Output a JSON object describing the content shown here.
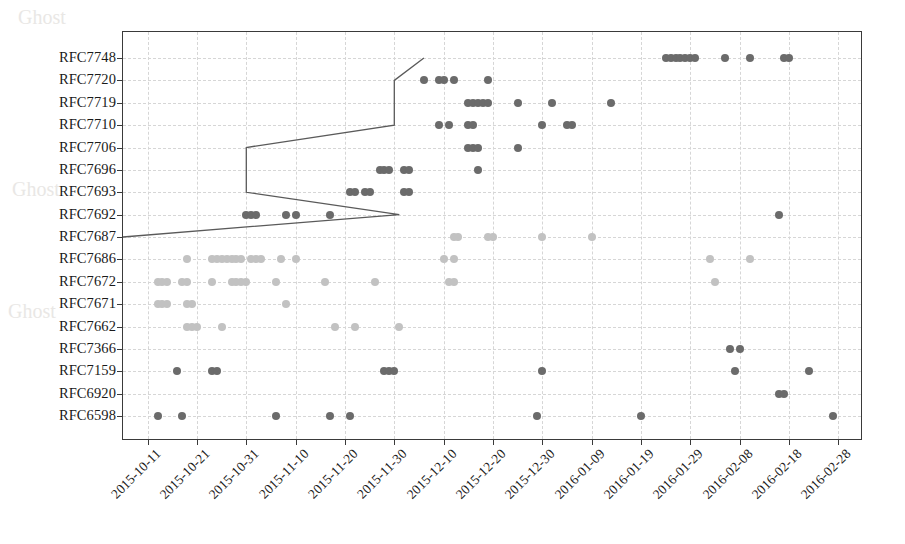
{
  "chart_data": {
    "type": "scatter",
    "title": "",
    "xlabel": "",
    "ylabel": "",
    "grid": true,
    "legend": false,
    "x_tick_labels": [
      "2015-10-11",
      "2015-10-21",
      "2015-10-31",
      "2015-11-10",
      "2015-11-20",
      "2015-11-30",
      "2015-12-10",
      "2015-12-20",
      "2015-12-30",
      "2016-01-09",
      "2016-01-19",
      "2016-01-29",
      "2016-02-08",
      "2016-02-18",
      "2016-02-28"
    ],
    "xlim": [
      "2015-10-06",
      "2016-03-04"
    ],
    "categories": [
      "RFC7748",
      "RFC7720",
      "RFC7719",
      "RFC7710",
      "RFC7706",
      "RFC7696",
      "RFC7693",
      "RFC7692",
      "RFC7687",
      "RFC7686",
      "RFC7672",
      "RFC7671",
      "RFC7662",
      "RFC7366",
      "RFC7159",
      "RFC6920",
      "RFC6598"
    ],
    "colors": {
      "point_dark": "#6b6b6b",
      "point_light": "#c2c2c2",
      "line": "#5a5a5a",
      "axis": "#3a3a3a",
      "grid": "#d6d6d6",
      "background": "#ffffff"
    },
    "series": [
      {
        "name": "RFC7748",
        "category_index": 0,
        "shade": "dark",
        "x": [
          "2016-01-24",
          "2016-01-25",
          "2016-01-26",
          "2016-01-27",
          "2016-01-28",
          "2016-01-29",
          "2016-01-30",
          "2016-02-05",
          "2016-02-10",
          "2016-02-17",
          "2016-02-18"
        ]
      },
      {
        "name": "RFC7720",
        "category_index": 1,
        "shade": "dark",
        "x": [
          "2015-12-06",
          "2015-12-09",
          "2015-12-10",
          "2015-12-12",
          "2015-12-19"
        ]
      },
      {
        "name": "RFC7719",
        "category_index": 2,
        "shade": "dark",
        "x": [
          "2015-12-15",
          "2015-12-16",
          "2015-12-17",
          "2015-12-18",
          "2015-12-19",
          "2015-12-25",
          "2016-01-01",
          "2016-01-13"
        ]
      },
      {
        "name": "RFC7710",
        "category_index": 3,
        "shade": "dark",
        "x": [
          "2015-12-09",
          "2015-12-11",
          "2015-12-15",
          "2015-12-16",
          "2015-12-30",
          "2016-01-04",
          "2016-01-05"
        ]
      },
      {
        "name": "RFC7706",
        "category_index": 4,
        "shade": "dark",
        "x": [
          "2015-12-15",
          "2015-12-16",
          "2015-12-17",
          "2015-12-25"
        ]
      },
      {
        "name": "RFC7696",
        "category_index": 5,
        "shade": "dark",
        "x": [
          "2015-11-27",
          "2015-11-28",
          "2015-11-29",
          "2015-12-02",
          "2015-12-03",
          "2015-12-17"
        ]
      },
      {
        "name": "RFC7693",
        "category_index": 6,
        "shade": "dark",
        "x": [
          "2015-11-21",
          "2015-11-22",
          "2015-11-24",
          "2015-11-25",
          "2015-12-02",
          "2015-12-03"
        ]
      },
      {
        "name": "RFC7692",
        "category_index": 7,
        "shade": "dark",
        "x": [
          "2015-10-31",
          "2015-11-01",
          "2015-11-02",
          "2015-11-08",
          "2015-11-10",
          "2015-11-17",
          "2016-02-16"
        ]
      },
      {
        "name": "RFC7687",
        "category_index": 8,
        "shade": "light",
        "x": [
          "2015-12-12",
          "2015-12-13",
          "2015-12-19",
          "2015-12-20",
          "2015-12-30",
          "2016-01-09"
        ]
      },
      {
        "name": "RFC7686",
        "category_index": 9,
        "shade": "light",
        "x": [
          "2015-10-19",
          "2015-10-24",
          "2015-10-25",
          "2015-10-26",
          "2015-10-27",
          "2015-10-28",
          "2015-10-29",
          "2015-10-30",
          "2015-11-01",
          "2015-11-02",
          "2015-11-03",
          "2015-11-07",
          "2015-11-10",
          "2015-12-10",
          "2015-12-12",
          "2016-02-02",
          "2016-02-10"
        ]
      },
      {
        "name": "RFC7672",
        "category_index": 10,
        "shade": "light",
        "x": [
          "2015-10-13",
          "2015-10-14",
          "2015-10-15",
          "2015-10-18",
          "2015-10-19",
          "2015-10-24",
          "2015-10-28",
          "2015-10-29",
          "2015-10-30",
          "2015-10-31",
          "2015-11-06",
          "2015-11-16",
          "2015-11-26",
          "2015-12-11",
          "2015-12-12",
          "2016-02-03"
        ]
      },
      {
        "name": "RFC7671",
        "category_index": 11,
        "shade": "light",
        "x": [
          "2015-10-13",
          "2015-10-14",
          "2015-10-15",
          "2015-10-19",
          "2015-10-20",
          "2015-11-08"
        ]
      },
      {
        "name": "RFC7662",
        "category_index": 12,
        "shade": "light",
        "x": [
          "2015-10-19",
          "2015-10-20",
          "2015-10-21",
          "2015-10-26",
          "2015-11-18",
          "2015-11-22",
          "2015-12-01"
        ]
      },
      {
        "name": "RFC7366",
        "category_index": 13,
        "shade": "dark",
        "x": [
          "2016-02-06",
          "2016-02-08"
        ]
      },
      {
        "name": "RFC7159",
        "category_index": 14,
        "shade": "dark",
        "x": [
          "2015-10-17",
          "2015-10-24",
          "2015-10-25",
          "2015-11-28",
          "2015-11-29",
          "2015-11-30",
          "2015-12-30",
          "2016-02-07",
          "2016-02-22"
        ]
      },
      {
        "name": "RFC6920",
        "category_index": 15,
        "shade": "dark",
        "x": [
          "2016-02-16",
          "2016-02-17"
        ]
      },
      {
        "name": "RFC6598",
        "category_index": 16,
        "shade": "dark",
        "x": [
          "2015-10-13",
          "2015-10-18",
          "2015-11-06",
          "2015-11-17",
          "2015-11-21",
          "2015-12-29",
          "2016-01-19",
          "2016-02-27"
        ]
      }
    ],
    "envelope_line": {
      "description": "piecewise step/boundary line",
      "points": [
        {
          "x": "2015-10-06",
          "category": "RFC7687"
        },
        {
          "x": "2015-12-01",
          "category": "RFC7692"
        },
        {
          "x": "2015-10-31",
          "category": "RFC7693"
        },
        {
          "x": "2015-10-31",
          "category": "RFC7706"
        },
        {
          "x": "2015-11-30",
          "category": "RFC7710"
        },
        {
          "x": "2015-11-30",
          "category": "RFC7720"
        },
        {
          "x": "2015-12-06",
          "category": "RFC7748"
        }
      ]
    }
  }
}
